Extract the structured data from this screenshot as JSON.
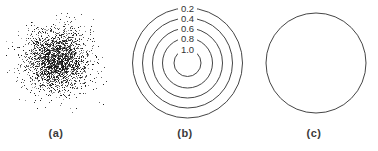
{
  "figure": {
    "panels": [
      {
        "caption": "(a)"
      },
      {
        "caption": "(b)"
      },
      {
        "caption": "(c)"
      }
    ]
  },
  "colors": {
    "background": "#ffffff",
    "line": "#454545",
    "contour_label_text": "#333333",
    "caption_text": "#3a3a3a",
    "point": "#141414"
  },
  "chart_data": [
    {
      "type": "scatter",
      "panel": "(a)",
      "description": "Dense 2D Gaussian random point cloud with no axes",
      "center_x": 57,
      "center_y": 60,
      "std_x": 16,
      "std_y": 16,
      "n_points": 2400
    },
    {
      "type": "line",
      "subtype": "contour",
      "panel": "(b)",
      "description": "Concentric circular density contours; each level label sits in a gap at the top of its ring, outermost to innermost",
      "levels": [
        "0.2",
        "0.4",
        "0.6",
        "0.8",
        "1.0"
      ],
      "radii": [
        55,
        45,
        35,
        25,
        13.5
      ],
      "center_x": 61.5,
      "center_y": 63
    },
    {
      "type": "line",
      "subtype": "circle",
      "panel": "(c)",
      "description": "Single unlabeled circle outline",
      "radius": 50,
      "center_x": 64,
      "center_y": 63
    }
  ]
}
